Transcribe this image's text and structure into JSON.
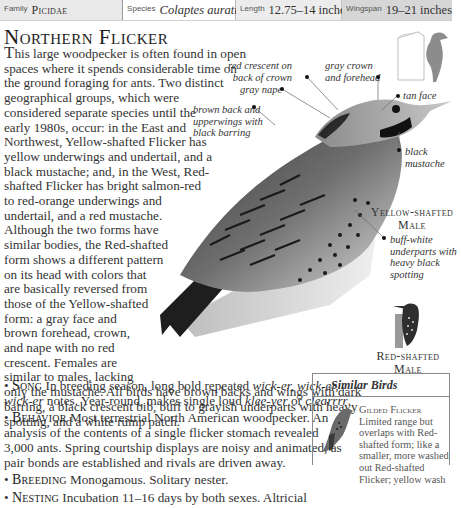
{
  "header": {
    "family_label": "Family",
    "family_value": "Picidae",
    "species_label": "Species",
    "species_value": "Colaptes auratus",
    "length_label": "Length",
    "length_value": "12.75–14 inches",
    "wingspan_label": "Wingspan",
    "wingspan_value": "19–21 inches"
  },
  "title": "Northern Flicker",
  "intro": {
    "drop": "T",
    "lines": [
      "his large woodpecker is often found in open",
      "spaces where it spends considerable time on",
      "the ground foraging for ants. Two distinct",
      "geographical groups, which were",
      "considered separate species until the",
      "early 1980s, occur: in the East and",
      "Northwest, Yellow-shafted Flicker has",
      "yellow underwings and undertail, and a",
      "black mustache; and, in the West, Red-",
      "shafted Flicker has bright salmon-red",
      "to red-orange underwings and",
      "undertail, and a red mustache.",
      "Although the two forms have",
      "similar bodies, the Red-shafted",
      "form shows a different pattern",
      "on its head with colors that",
      "are basically reversed from",
      "those of the Yellow-shafted",
      "form: a gray face and",
      "brown forehead, crown,",
      "and nape with no red",
      "crescent. Females are",
      "similar to males, lacking",
      "only the mustache. All birds have brown backs and wings with dark",
      "barring, a black crescent bib, buff to grayish underparts with heavy",
      "spotting, and a white rump patch."
    ]
  },
  "facts": {
    "song": {
      "heading": "Song",
      "l1_a": "In breeding season, long bold repeated ",
      "l1_b": "wick-er, wick-er,",
      "l2_a": "wick-er",
      "l2_b": " notes. Year-round, makes single loud ",
      "l2_c": "klee-yer",
      "l2_d": " or ",
      "l2_e": "clearrrr",
      "l2_f": "."
    },
    "behavior": {
      "heading": "Behavior",
      "lines": [
        " Most terrestrial North American woodpecker. An",
        "analysis of the contents of a single flicker stomach revealed",
        "3,000 ants. Spring courtship displays are noisy and animated, as",
        "pair bonds are established and rivals are driven away."
      ]
    },
    "breeding": {
      "heading": "Breeding",
      "text": " Monogamous. Solitary nester."
    },
    "nesting": {
      "heading": "Nesting",
      "text": " Incubation 11–16 days by both sexes. Altricial"
    }
  },
  "annotations": {
    "red_crescent": [
      "red crescent on",
      "back of crown"
    ],
    "gray_crown": [
      "gray crown",
      "and forehead"
    ],
    "gray_nape": "gray nape",
    "tan_face": "tan face",
    "brown_back": [
      "brown back and",
      "upperwings with",
      "black barring"
    ],
    "black_mustache": [
      "black",
      "mustache"
    ],
    "buff_white": [
      "buff-white",
      "underparts with",
      "heavy black",
      "spotting"
    ]
  },
  "captions": {
    "yellow_shafted": [
      "Yellow-shafted",
      "Male"
    ],
    "red_shafted": [
      "Red-shafted",
      "Male"
    ]
  },
  "similar_birds": {
    "heading": "Similar Birds",
    "items": [
      {
        "name": "Gilded Flicker",
        "lines": [
          "Limited range but",
          "overlaps with Red-",
          "shafted form; like a",
          "smaller, more washed",
          "out Red-shafted",
          "Flicker; yellow wash"
        ]
      }
    ]
  },
  "colors": {
    "text": "#333333",
    "header_family_bg": "#e9e9e9",
    "header_length_bg": "#ececec",
    "header_wingspan_bg": "#d6d6d6"
  }
}
